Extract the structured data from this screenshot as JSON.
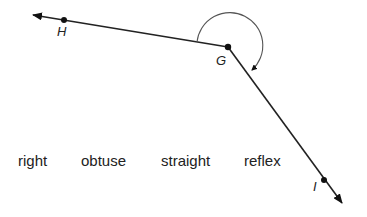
{
  "diagram": {
    "points": {
      "H": "H",
      "G": "G",
      "I": "I"
    },
    "choices": [
      "right",
      "obtuse",
      "straight",
      "reflex"
    ]
  }
}
